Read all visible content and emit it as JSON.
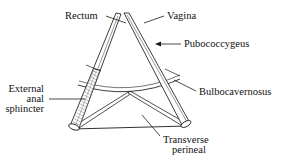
{
  "figure": {
    "type": "anatomical-line-diagram",
    "background_color": "#ffffff",
    "line_color": "#1a1a1a",
    "text_color": "#111111",
    "fill_color": "#ffffff",
    "hatch_color": "#6b6b6b"
  },
  "labels": {
    "rectum": "Rectum",
    "vagina": "Vagina",
    "pubococcygeus": "Pubococcygeus",
    "bulbocavernosus": "Bulbocavernosus",
    "external_anal_sphincter_line1": "External",
    "external_anal_sphincter_line2": "anal",
    "external_anal_sphincter_line3": "sphincter",
    "transverse_perineal_line1": "Transverse",
    "transverse_perineal_line2": "perineal"
  },
  "structures": [
    {
      "name": "rectum",
      "label": "Rectum",
      "kind": "tube",
      "description": "Left tubular limb running from apex down to lower left"
    },
    {
      "name": "vagina",
      "label": "Vagina",
      "kind": "tube",
      "description": "Right tubular limb running from apex down to lower right"
    },
    {
      "name": "pubococcygeus",
      "label": "Pubococcygeus",
      "kind": "muscle-band",
      "description": "Paired bands forming the converging limbs of the triangle"
    },
    {
      "name": "bulbocavernosus",
      "label": "Bulbocavernosus",
      "kind": "arc",
      "description": "Curved band arcing between the two limbs at mid height"
    },
    {
      "name": "external-anal-sphincter",
      "label": "External anal sphincter",
      "kind": "hatched-band",
      "description": "Stippled band on lower portion of the left limb"
    },
    {
      "name": "transverse-perineal",
      "label": "Transverse perineal",
      "kind": "v-strut",
      "description": "Two straight bands from lower corners meeting at a central point"
    }
  ]
}
